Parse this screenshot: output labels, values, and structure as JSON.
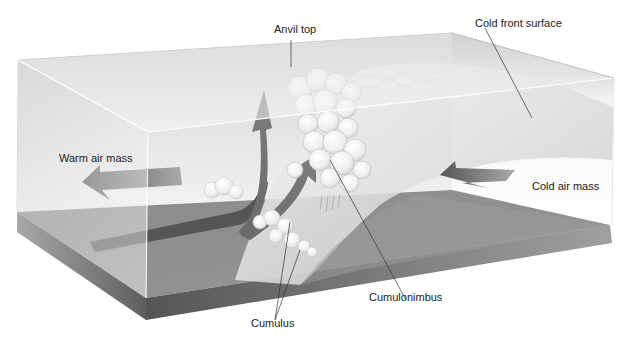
{
  "diagram": {
    "labels": {
      "anvil_top": "Anvil top",
      "cold_front_surface": "Cold front surface",
      "warm_air_mass": "Warm air mass",
      "cold_air_mass": "Cold air mass",
      "cumulonimbus": "Cumulonimbus",
      "cumulus": "Cumulus"
    },
    "elements": {
      "box": "transparent-atmosphere-block",
      "ground": "ground-slab",
      "front_surface": "curved-cold-front-wedge",
      "warm_arrow": "left-pointing-arrow",
      "cold_arrow": "left-pointing-arrow",
      "updraft_arrows": "two-curved-rising-arrows",
      "clouds": [
        "cumulonimbus-tower",
        "anvil-streamer",
        "cumulus-cluster"
      ]
    },
    "colors": {
      "ground_top": "#8c8c8c",
      "ground_side": "#6e6e6e",
      "front_surface": "#d9d9d9",
      "arrow": "#6a6a6a",
      "box_face": "#e8e8e8",
      "cloud": "#f4f4f4",
      "leader_line": "#333333"
    }
  }
}
